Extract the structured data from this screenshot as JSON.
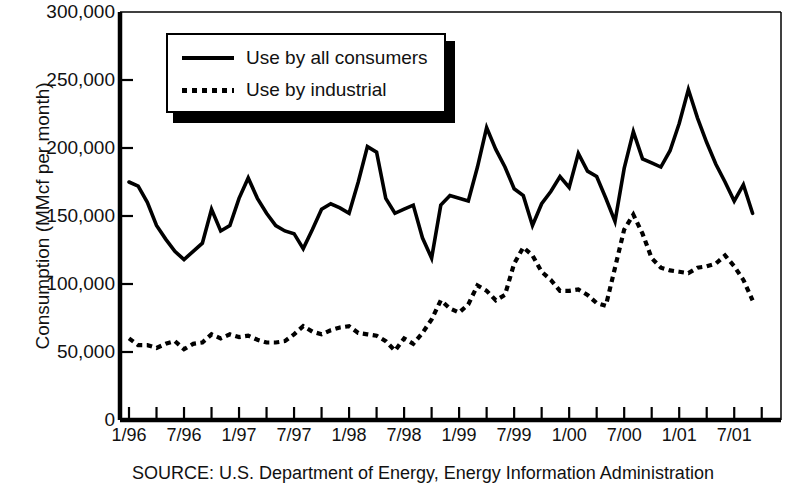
{
  "figure": {
    "source_note": "SOURCE: U.S. Department of Energy, Energy Information Administration"
  },
  "legend": {
    "entries": [
      {
        "label": "Use by all consumers",
        "style": "solid"
      },
      {
        "label": "Use by industrial",
        "style": "dotted"
      }
    ]
  },
  "chart_data": {
    "type": "line",
    "title": "",
    "subtitle": "",
    "xlabel": "",
    "ylabel": "Consumption (MMcf per month)",
    "ylim": [
      0,
      300000
    ],
    "ytick_labels": [
      "300,000",
      "250,000",
      "200,000",
      "150,000",
      "100,000",
      "50,000",
      "0"
    ],
    "ytick_values": [
      300000,
      250000,
      200000,
      150000,
      100000,
      50000,
      0
    ],
    "xtick_labels": [
      "1/96",
      "7/96",
      "1/97",
      "7/97",
      "1/98",
      "7/98",
      "1/99",
      "7/99",
      "1/00",
      "7/00",
      "1/01",
      "7/01"
    ],
    "xtick_months": [
      0,
      6,
      12,
      18,
      24,
      30,
      36,
      42,
      48,
      54,
      60,
      66
    ],
    "grid": false,
    "legend_position": "top-left-inside",
    "axis_style": "left-and-bottom-spine",
    "x": [
      "1/96",
      "2/96",
      "3/96",
      "4/96",
      "5/96",
      "6/96",
      "7/96",
      "8/96",
      "9/96",
      "10/96",
      "11/96",
      "12/96",
      "1/97",
      "2/97",
      "3/97",
      "4/97",
      "5/97",
      "6/97",
      "7/97",
      "8/97",
      "9/97",
      "10/97",
      "11/97",
      "12/97",
      "1/98",
      "2/98",
      "3/98",
      "4/98",
      "5/98",
      "6/98",
      "7/98",
      "8/98",
      "9/98",
      "10/98",
      "11/98",
      "12/98",
      "1/99",
      "2/99",
      "3/99",
      "4/99",
      "5/99",
      "6/99",
      "7/99",
      "8/99",
      "9/99",
      "10/99",
      "11/99",
      "12/99",
      "1/00",
      "2/00",
      "3/00",
      "4/00",
      "5/00",
      "6/00",
      "7/00",
      "8/00",
      "9/00",
      "10/00",
      "11/00",
      "12/00",
      "1/01",
      "2/01",
      "3/01",
      "4/01",
      "5/01",
      "6/01",
      "7/01",
      "8/01",
      "9/01"
    ],
    "series": [
      {
        "name": "Use by all consumers",
        "style": "solid",
        "values": [
          175000,
          172000,
          160000,
          143000,
          133000,
          124000,
          118000,
          124000,
          130000,
          155000,
          139000,
          143000,
          163000,
          178000,
          163000,
          152000,
          143000,
          139000,
          137000,
          126000,
          140000,
          155000,
          159000,
          156000,
          152000,
          175000,
          201000,
          197000,
          163000,
          152000,
          155000,
          158000,
          134000,
          119000,
          158000,
          165000,
          163000,
          161000,
          186000,
          215000,
          199000,
          186000,
          170000,
          165000,
          143000,
          159000,
          168000,
          179000,
          171000,
          196000,
          183000,
          179000,
          163000,
          146000,
          185000,
          212000,
          192000,
          189000,
          186000,
          198000,
          218000,
          243000,
          222000,
          204000,
          188000,
          175000,
          161000,
          173000,
          152000
        ]
      },
      {
        "name": "Use by industrial",
        "style": "dotted",
        "values": [
          60000,
          55000,
          55000,
          53000,
          56000,
          58000,
          52000,
          56000,
          57000,
          63000,
          60000,
          63000,
          61000,
          62000,
          59000,
          57000,
          57000,
          58000,
          63000,
          69000,
          65000,
          63000,
          66000,
          68000,
          69000,
          64000,
          63000,
          62000,
          58000,
          51000,
          60000,
          56000,
          64000,
          74000,
          88000,
          82000,
          79000,
          85000,
          99000,
          95000,
          88000,
          92000,
          115000,
          127000,
          121000,
          109000,
          103000,
          95000,
          95000,
          96000,
          92000,
          86000,
          84000,
          112000,
          140000,
          151000,
          137000,
          119000,
          112000,
          110000,
          109000,
          108000,
          112000,
          113000,
          115000,
          121000,
          113000,
          103000,
          88000
        ]
      }
    ]
  }
}
